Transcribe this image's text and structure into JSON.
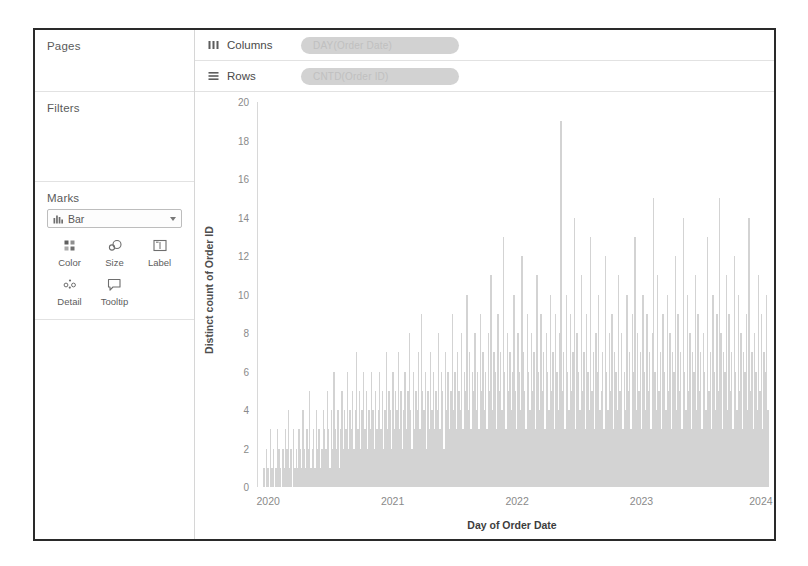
{
  "shelves": {
    "pages": {
      "title": "Pages"
    },
    "filters": {
      "title": "Filters"
    },
    "marks": {
      "title": "Marks",
      "mark_type": "Bar",
      "mark_type_icon": "bar-chart-icon",
      "buttons": [
        {
          "label": "Color",
          "icon": "color-palette-icon"
        },
        {
          "label": "Size",
          "icon": "size-circles-icon"
        },
        {
          "label": "Label",
          "icon": "label-text-icon"
        },
        {
          "label": "Detail",
          "icon": "detail-dots-icon"
        },
        {
          "label": "Tooltip",
          "icon": "tooltip-bubble-icon"
        }
      ]
    },
    "columns": {
      "label": "Columns",
      "icon": "columns-icon",
      "pill": "DAY(Order Date)"
    },
    "rows": {
      "label": "Rows",
      "icon": "rows-icon",
      "pill": "CNTD(Order ID)"
    }
  },
  "colors": {
    "bar": "#d3d3d3",
    "pill": "#d2d2d2",
    "axis": "#d8d8d8",
    "border": "#2a2a2a",
    "tick_text": "#8a8a8a"
  },
  "chart_data": {
    "type": "bar",
    "title": "",
    "xlabel": "Day of Order Date",
    "ylabel": "Distinct count of Order ID",
    "ylim": [
      0,
      20
    ],
    "yticks": [
      0,
      2,
      4,
      6,
      8,
      10,
      12,
      14,
      16,
      18,
      20
    ],
    "xticks": [
      "2020",
      "2021",
      "2022",
      "2023",
      "2024"
    ],
    "xtick_positions_pct": [
      2.0,
      26.5,
      51.0,
      75.5,
      99.0
    ],
    "grid": false,
    "legend": null,
    "note": "Daily distinct order counts, one bar per day from Jan 2020 through Dec 2023.",
    "x_start": "2020",
    "x_end": "2024",
    "n_bars": 365,
    "max_value": 19,
    "min_value": 0,
    "values": [
      0,
      0,
      0,
      0,
      1,
      0,
      2,
      1,
      0,
      3,
      1,
      2,
      0,
      1,
      3,
      2,
      1,
      0,
      2,
      1,
      3,
      2,
      4,
      1,
      2,
      0,
      3,
      1,
      2,
      1,
      3,
      2,
      1,
      4,
      2,
      1,
      3,
      2,
      5,
      1,
      2,
      3,
      1,
      4,
      2,
      3,
      1,
      2,
      4,
      3,
      2,
      5,
      3,
      1,
      4,
      2,
      6,
      3,
      2,
      4,
      1,
      3,
      5,
      2,
      4,
      3,
      6,
      2,
      4,
      3,
      5,
      2,
      4,
      7,
      3,
      5,
      2,
      4,
      6,
      3,
      5,
      2,
      4,
      3,
      6,
      4,
      2,
      5,
      3,
      4,
      6,
      3,
      5,
      2,
      4,
      7,
      3,
      5,
      4,
      2,
      6,
      3,
      5,
      4,
      7,
      3,
      5,
      2,
      4,
      6,
      3,
      5,
      8,
      4,
      2,
      6,
      3,
      5,
      4,
      7,
      3,
      9,
      5,
      4,
      6,
      2,
      5,
      3,
      7,
      4,
      6,
      3,
      5,
      4,
      8,
      3,
      6,
      5,
      2,
      7,
      4,
      6,
      3,
      5,
      9,
      4,
      6,
      3,
      7,
      5,
      4,
      8,
      3,
      6,
      5,
      10,
      4,
      7,
      3,
      6,
      5,
      8,
      4,
      6,
      3,
      9,
      5,
      7,
      4,
      6,
      3,
      8,
      5,
      11,
      4,
      7,
      6,
      3,
      9,
      5,
      7,
      4,
      13,
      6,
      3,
      8,
      5,
      7,
      4,
      6,
      10,
      5,
      3,
      8,
      6,
      4,
      12,
      7,
      5,
      3,
      9,
      6,
      4,
      8,
      5,
      7,
      3,
      11,
      6,
      4,
      9,
      5,
      7,
      3,
      8,
      6,
      4,
      10,
      5,
      7,
      3,
      9,
      6,
      4,
      8,
      19,
      5,
      7,
      3,
      10,
      6,
      4,
      9,
      5,
      7,
      14,
      3,
      8,
      6,
      4,
      11,
      5,
      7,
      3,
      9,
      6,
      4,
      13,
      5,
      7,
      3,
      8,
      6,
      10,
      4,
      5,
      7,
      3,
      12,
      6,
      4,
      8,
      5,
      9,
      3,
      7,
      6,
      4,
      11,
      5,
      8,
      3,
      6,
      4,
      10,
      5,
      7,
      3,
      9,
      6,
      13,
      4,
      8,
      5,
      7,
      3,
      10,
      6,
      4,
      9,
      5,
      7,
      3,
      8,
      15,
      6,
      4,
      11,
      5,
      7,
      3,
      9,
      6,
      4,
      10,
      5,
      8,
      3,
      7,
      6,
      12,
      4,
      9,
      5,
      7,
      3,
      14,
      6,
      4,
      10,
      5,
      8,
      3,
      7,
      6,
      11,
      4,
      9,
      5,
      7,
      3,
      8,
      6,
      4,
      13,
      5,
      7,
      3,
      10,
      6,
      4,
      9,
      5,
      15,
      8,
      3,
      7,
      6,
      11,
      4,
      9,
      5,
      7,
      3,
      12,
      6,
      4,
      10,
      5,
      8,
      3,
      7,
      6,
      9,
      4,
      14,
      5,
      7,
      3,
      8,
      6,
      4,
      11,
      5,
      9,
      3,
      7,
      6,
      10,
      4
    ]
  }
}
